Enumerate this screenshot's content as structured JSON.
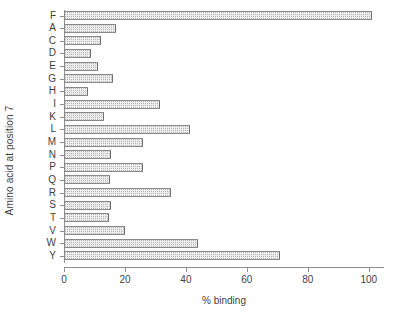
{
  "chart_data": {
    "type": "bar",
    "orientation": "horizontal",
    "title": "",
    "xlabel": "% binding",
    "ylabel": "Amino acid at position 7",
    "categories": [
      "F",
      "A",
      "C",
      "D",
      "E",
      "G",
      "H",
      "I",
      "K",
      "L",
      "M",
      "N",
      "P",
      "Q",
      "R",
      "S",
      "T",
      "V",
      "W",
      "Y"
    ],
    "values": [
      101,
      17,
      12,
      9,
      11,
      16,
      8,
      31.5,
      13,
      41.5,
      26,
      15.5,
      25.8,
      15,
      35,
      15.5,
      14.7,
      20,
      44,
      70.8
    ],
    "series": [
      {
        "name": "% binding",
        "values": [
          101,
          17,
          12,
          9,
          11,
          16,
          8,
          31.5,
          13,
          41.5,
          26,
          15.5,
          25.8,
          15,
          35,
          15.5,
          14.7,
          20,
          44,
          70.8
        ]
      }
    ],
    "xlim": [
      0,
      105
    ],
    "xticks": [
      0,
      20,
      40,
      60,
      80,
      100
    ],
    "xtick_labels": [
      "0",
      "20",
      "40",
      "60",
      "80",
      "100"
    ],
    "grid": false,
    "legend": false,
    "bar_fill_color": "#ececec",
    "bar_border_color": "#8a8a8a",
    "axis_color": "#8d8d8d",
    "background_color": "#ffffff"
  },
  "axes": {
    "x_title": "% binding",
    "y_title": "Amino acid at position 7"
  }
}
